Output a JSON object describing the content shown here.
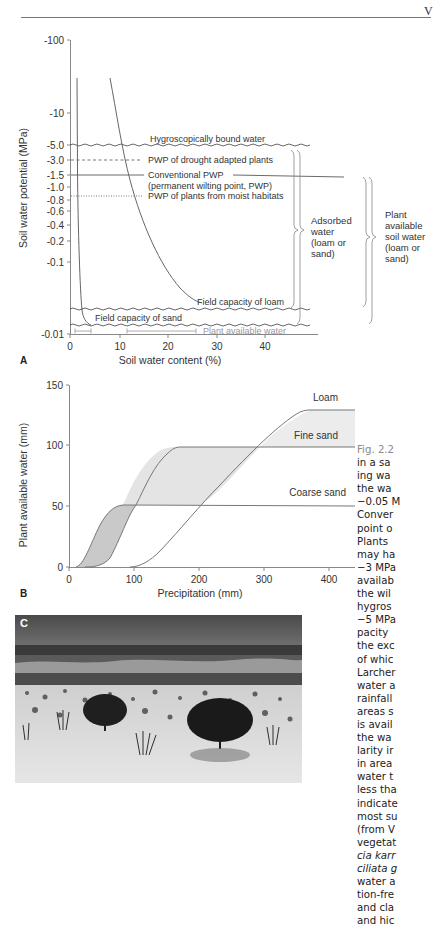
{
  "page": {
    "running_head": "V"
  },
  "panel_a": {
    "label": "A",
    "ylabel": "Soil water potential (MPa)",
    "xlabel": "Soil water content (%)",
    "y_ticks": [
      "-100",
      "-10",
      "-5.0",
      "-3.0",
      "-1.5",
      "-1.0",
      "-0.8",
      "-0.6",
      "-0.4",
      "-0.2",
      "-0.1",
      "-0.01"
    ],
    "x_ticks": [
      "0",
      "10",
      "20",
      "30",
      "40"
    ],
    "annotations": {
      "hygroscopic": "Hygroscopically bound water",
      "pwp_drought": "PWP of drought adapted plants",
      "conventional_pwp_1": "Conventional PWP",
      "conventional_pwp_2": "(permanent wilting point, PWP)",
      "pwp_moist": "PWP of plants from moist habitats",
      "fc_loam": "Field capacity of loam",
      "fc_sand": "Field capacity of sand",
      "plant_available": "Plant available water"
    },
    "bracket_adsorbed": [
      "Adsorbed",
      "water",
      "(loam or",
      "sand)"
    ],
    "bracket_plant_available": [
      "Plant",
      "available",
      "soil water",
      "(loam or",
      "sand)"
    ]
  },
  "panel_b": {
    "label": "B",
    "ylabel": "Plant available water (mm)",
    "xlabel": "Precipitation (mm)",
    "y_ticks": [
      "150",
      "100",
      "50",
      "0"
    ],
    "x_ticks": [
      "0",
      "100",
      "200",
      "300",
      "400"
    ],
    "series_labels": [
      "Loam",
      "Fine sand",
      "Coarse sand"
    ]
  },
  "panel_c": {
    "label": "C",
    "description": "Photograph of sandy semi-desert with scattered trees and grass tussocks"
  },
  "caption": {
    "lines": [
      {
        "t": "Fig. 2.2",
        "cls": "fig"
      },
      {
        "t": "in a sa",
        "cls": ""
      },
      {
        "t": "ing wa",
        "cls": ""
      },
      {
        "t": "the wa",
        "cls": ""
      },
      {
        "t": "−0.05 M",
        "cls": ""
      },
      {
        "t": "Conver",
        "cls": ""
      },
      {
        "t": "point o",
        "cls": ""
      },
      {
        "t": "Plants",
        "cls": ""
      },
      {
        "t": "may ha",
        "cls": ""
      },
      {
        "t": "−3 MPa",
        "cls": ""
      },
      {
        "t": "availab",
        "cls": ""
      },
      {
        "t": "the wil",
        "cls": ""
      },
      {
        "t": "hygros",
        "cls": ""
      },
      {
        "t": "−5 MPa",
        "cls": ""
      },
      {
        "t": "pacity",
        "cls": ""
      },
      {
        "t": "the exc",
        "cls": ""
      },
      {
        "t": "of whic",
        "cls": ""
      },
      {
        "t": "Larcher",
        "cls": ""
      },
      {
        "t": "water a",
        "cls": ""
      },
      {
        "t": "rainfall",
        "cls": ""
      },
      {
        "t": "areas s",
        "cls": ""
      },
      {
        "t": "is avail",
        "cls": ""
      },
      {
        "t": "the wa",
        "cls": ""
      },
      {
        "t": "larity ir",
        "cls": ""
      },
      {
        "t": "in area",
        "cls": ""
      },
      {
        "t": "water t",
        "cls": ""
      },
      {
        "t": "less tha",
        "cls": ""
      },
      {
        "t": "indicate",
        "cls": ""
      },
      {
        "t": "most su",
        "cls": ""
      },
      {
        "t": "(from V",
        "cls": ""
      },
      {
        "t": "vegetat",
        "cls": ""
      },
      {
        "t": "cia karr",
        "cls": "it"
      },
      {
        "t": "ciliata g",
        "cls": "it"
      },
      {
        "t": "water a",
        "cls": ""
      },
      {
        "t": "tion-fre",
        "cls": ""
      },
      {
        "t": "and cla",
        "cls": ""
      },
      {
        "t": "and hic",
        "cls": ""
      }
    ]
  },
  "chart_data": [
    {
      "type": "line",
      "title": "A",
      "xlabel": "Soil water content (%)",
      "ylabel": "Soil water potential (MPa)",
      "y_scale": "log (negative)",
      "ylim": [
        -0.01,
        -100
      ],
      "xlim": [
        0,
        50
      ],
      "y_ticks": [
        -100,
        -10,
        -5.0,
        -3.0,
        -1.5,
        -1.0,
        -0.8,
        -0.6,
        -0.4,
        -0.2,
        -0.1,
        -0.01
      ],
      "x_ticks": [
        0,
        10,
        20,
        30,
        40
      ],
      "series": [
        {
          "name": "Sand",
          "x": [
            1.2,
            1.5,
            2,
            2.6,
            3.2,
            3.8
          ],
          "y": [
            -30,
            -5,
            -1.5,
            -0.3,
            -0.05,
            -0.015
          ]
        },
        {
          "name": "Loam",
          "x": [
            8.5,
            10,
            12,
            16,
            22,
            28
          ],
          "y": [
            -30,
            -5,
            -1.5,
            -0.3,
            -0.06,
            -0.025
          ]
        }
      ],
      "reference_lines": [
        {
          "label": "Hygroscopically bound water",
          "y": -5.0,
          "style": "wavy"
        },
        {
          "label": "PWP of drought adapted plants",
          "y": -3.0,
          "style": "dashed"
        },
        {
          "label": "Conventional PWP (permanent wilting point, PWP)",
          "y": -1.5,
          "style": "solid"
        },
        {
          "label": "PWP of plants from moist habitats",
          "y": -0.7,
          "style": "dotted"
        },
        {
          "label": "Field capacity of loam",
          "y": -0.025,
          "style": "wavy"
        },
        {
          "label": "Field capacity of sand",
          "y": -0.015,
          "style": "wavy"
        }
      ],
      "annotations": [
        "Plant available water (sand: ~1–4%, loam: ~12–26%)",
        "Adsorbed water (loam or sand)",
        "Plant available soil water (loam or sand)"
      ]
    },
    {
      "type": "line",
      "title": "B",
      "xlabel": "Precipitation (mm)",
      "ylabel": "Plant available water (mm)",
      "xlim": [
        0,
        470
      ],
      "ylim": [
        0,
        150
      ],
      "x_ticks": [
        0,
        100,
        200,
        300,
        400
      ],
      "y_ticks": [
        0,
        50,
        100,
        150
      ],
      "series": [
        {
          "name": "Coarse sand",
          "x": [
            0,
            20,
            50,
            80,
            110,
            470
          ],
          "y": [
            0,
            0,
            15,
            38,
            47,
            46
          ]
        },
        {
          "name": "Fine sand",
          "x": [
            0,
            50,
            90,
            130,
            170,
            210,
            470
          ],
          "y": [
            0,
            0,
            20,
            50,
            72,
            80,
            80
          ]
        },
        {
          "name": "Loam",
          "x": [
            0,
            110,
            150,
            220,
            290,
            370,
            470
          ],
          "y": [
            0,
            0,
            15,
            45,
            85,
            121,
            121
          ]
        }
      ],
      "shaded_regions": [
        "between Coarse sand and Fine sand (darker)",
        "between Fine sand and Loam (lighter)"
      ]
    }
  ]
}
